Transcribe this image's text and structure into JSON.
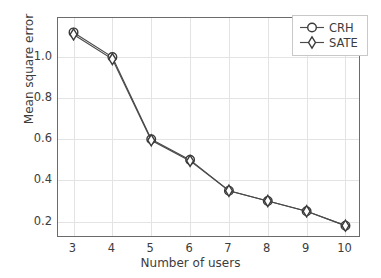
{
  "chart_data": {
    "type": "line",
    "title": "",
    "xlabel": "Number of users",
    "ylabel": "Mean square error",
    "x": [
      3,
      4,
      5,
      6,
      7,
      8,
      9,
      10
    ],
    "xticklabels": [
      "3",
      "4",
      "5",
      "6",
      "7",
      "8",
      "9",
      "10"
    ],
    "yticks": [
      0.2,
      0.4,
      0.6,
      0.8,
      1.0
    ],
    "yticklabels": [
      "0.2",
      "0.4",
      "0.6",
      "0.8",
      "1.0"
    ],
    "xlim": [
      2.6,
      10.4
    ],
    "ylim": [
      0.12,
      1.19
    ],
    "grid": true,
    "legend_position": "upper right",
    "series": [
      {
        "name": "CRH",
        "marker": "circle",
        "color": "#4a4a4a",
        "values": [
          1.12,
          1.0,
          0.6,
          0.5,
          0.35,
          0.3,
          0.25,
          0.18
        ]
      },
      {
        "name": "SATE",
        "marker": "diamond",
        "color": "#4a4a4a",
        "values": [
          1.11,
          0.99,
          0.595,
          0.495,
          0.35,
          0.3,
          0.25,
          0.18
        ]
      }
    ]
  },
  "legend": {
    "entries": [
      {
        "label": "CRH",
        "marker": "circle"
      },
      {
        "label": "SATE",
        "marker": "diamond"
      }
    ]
  },
  "colors": {
    "line": "#4a4a4a",
    "marker_edge": "#3a3a3a",
    "marker_face": "#ffffff",
    "grid": "#e3e3e3",
    "axis": "#6b6b6b",
    "text": "#3c3c3c",
    "background": "#ffffff"
  }
}
